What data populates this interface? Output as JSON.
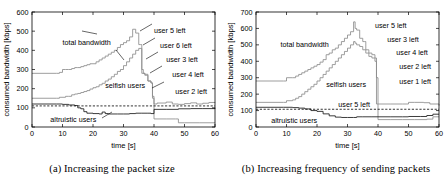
{
  "figure": {
    "panels": [
      {
        "id": "panel-a",
        "caption": "(a) Increasing the packet size",
        "chart_index": 0
      },
      {
        "id": "panel-b",
        "caption": "(b) Increasing frequency of sending packets",
        "chart_index": 1
      }
    ]
  },
  "chart_data": [
    {
      "type": "line",
      "title": "",
      "xlabel": "time [s]",
      "ylabel": "consumed bandwidth [kbps]",
      "xlim": [
        0,
        60
      ],
      "ylim": [
        0,
        600
      ],
      "xticks": [
        0,
        10,
        20,
        30,
        40,
        50,
        60
      ],
      "yticks": [
        0,
        100,
        200,
        300,
        400,
        500,
        600
      ],
      "grid": false,
      "legend": "none",
      "series": [
        {
          "name": "total bandwidth",
          "color": "#8c8c8c",
          "style": "step-gray",
          "x": [
            0,
            8,
            9,
            10,
            11,
            12,
            13,
            14,
            15,
            16,
            17,
            18,
            19,
            20,
            21,
            22,
            23,
            24,
            25,
            26,
            27,
            28,
            29,
            30,
            31,
            32,
            33,
            34,
            35,
            35.5,
            36,
            36.5,
            37,
            38,
            39,
            39.5,
            40,
            41,
            44,
            46,
            48,
            50,
            52,
            54,
            56,
            58,
            60
          ],
          "y": [
            280,
            280,
            285,
            300,
            300,
            300,
            305,
            310,
            310,
            315,
            320,
            325,
            330,
            330,
            340,
            350,
            360,
            370,
            380,
            390,
            400,
            415,
            430,
            440,
            450,
            470,
            510,
            490,
            430,
            430,
            300,
            280,
            275,
            240,
            230,
            160,
            120,
            125,
            130,
            120,
            118,
            122,
            126,
            120,
            124,
            128,
            130
          ]
        },
        {
          "name": "selfish users",
          "color": "#8c8c8c",
          "style": "step-gray",
          "x": [
            0,
            8,
            9,
            11,
            12,
            13,
            14,
            15,
            16,
            17,
            18,
            19,
            20,
            21,
            22,
            23,
            24,
            25,
            26,
            27,
            28,
            29,
            30,
            31,
            32,
            33,
            34,
            35,
            36,
            37,
            38,
            39,
            39.5,
            40,
            44,
            47,
            48,
            50,
            55,
            60
          ],
          "y": [
            150,
            150,
            155,
            160,
            160,
            168,
            172,
            175,
            180,
            185,
            190,
            198,
            205,
            210,
            220,
            228,
            240,
            250,
            262,
            275,
            290,
            300,
            320,
            340,
            360,
            380,
            400,
            410,
            280,
            270,
            240,
            230,
            150,
            42,
            42,
            42,
            22,
            22,
            22,
            22
          ]
        },
        {
          "name": "altruistic users",
          "color": "#1a1a1a",
          "style": "step-black",
          "x": [
            0,
            8,
            10,
            12,
            14,
            15,
            16,
            17,
            18,
            20,
            22,
            23,
            24,
            25,
            28,
            30,
            32,
            34,
            36,
            38,
            39,
            40,
            44,
            48,
            52,
            56,
            60
          ],
          "y": [
            120,
            120,
            118,
            115,
            112,
            100,
            95,
            80,
            72,
            70,
            68,
            78,
            70,
            68,
            68,
            68,
            70,
            72,
            72,
            72,
            70,
            92,
            92,
            95,
            96,
            96,
            100
          ]
        },
        {
          "name": "threshold",
          "color": "#000000",
          "style": "dashed",
          "x": [
            0,
            60
          ],
          "y": [
            110,
            110
          ]
        }
      ],
      "annotations": [
        {
          "text": "total bandwidth",
          "x": 10,
          "y": 440
        },
        {
          "text": "selfish users",
          "x": 24,
          "y": 215
        },
        {
          "text": "altruistic users",
          "x": 6,
          "y": 40
        },
        {
          "text": "user 5 left",
          "x": 40,
          "y": 505
        },
        {
          "text": "user 6 left",
          "x": 42,
          "y": 425
        },
        {
          "text": "user 3 left",
          "x": 44,
          "y": 350
        },
        {
          "text": "user 4 left",
          "x": 46,
          "y": 275
        },
        {
          "text": "user 2 left",
          "x": 47,
          "y": 185
        }
      ]
    },
    {
      "type": "line",
      "title": "",
      "xlabel": "time [s]",
      "ylabel": "consumed bandwidth [kbps]",
      "xlim": [
        0,
        60
      ],
      "ylim": [
        0,
        700
      ],
      "xticks": [
        0,
        10,
        20,
        30,
        40,
        50,
        60
      ],
      "yticks": [
        0,
        100,
        200,
        300,
        400,
        500,
        600,
        700
      ],
      "grid": false,
      "legend": "none",
      "series": [
        {
          "name": "total bandwidth",
          "color": "#8c8c8c",
          "style": "step-gray",
          "x": [
            0,
            9,
            10,
            12,
            13,
            14,
            15,
            16,
            17,
            18,
            19,
            20,
            21,
            22,
            23,
            24,
            25,
            26,
            27,
            28,
            29,
            30,
            31,
            32,
            32.5,
            33,
            34,
            35,
            35.5,
            36,
            37,
            38,
            39,
            39.5,
            40,
            44,
            48,
            50,
            52,
            55,
            57,
            60
          ],
          "y": [
            280,
            280,
            300,
            300,
            310,
            320,
            330,
            340,
            350,
            360,
            370,
            380,
            395,
            410,
            440,
            450,
            470,
            480,
            500,
            520,
            540,
            560,
            580,
            640,
            600,
            590,
            540,
            520,
            520,
            470,
            450,
            440,
            420,
            300,
            140,
            140,
            140,
            150,
            150,
            148,
            140,
            130
          ]
        },
        {
          "name": "selfish users",
          "color": "#8c8c8c",
          "style": "step-gray",
          "x": [
            0,
            9,
            10,
            12,
            13,
            14,
            15,
            16,
            17,
            18,
            19,
            20,
            21,
            22,
            23,
            24,
            25,
            26,
            27,
            28,
            29,
            30,
            31,
            32,
            32.5,
            33,
            34,
            35,
            36,
            37,
            38,
            39,
            39.5,
            40,
            44,
            48,
            52,
            56,
            58,
            60
          ],
          "y": [
            150,
            150,
            160,
            165,
            175,
            185,
            200,
            215,
            230,
            245,
            260,
            280,
            300,
            320,
            340,
            360,
            380,
            400,
            420,
            440,
            460,
            480,
            500,
            520,
            510,
            500,
            490,
            470,
            450,
            430,
            420,
            400,
            140,
            45,
            45,
            45,
            45,
            48,
            62,
            62
          ]
        },
        {
          "name": "altruistic users",
          "color": "#1a1a1a",
          "style": "step-black",
          "x": [
            0,
            9,
            12,
            14,
            16,
            18,
            20,
            22,
            24,
            26,
            28,
            30,
            32,
            33,
            35,
            38,
            40,
            44,
            48,
            50,
            54,
            56,
            58,
            60
          ],
          "y": [
            120,
            120,
            118,
            115,
            110,
            100,
            95,
            80,
            68,
            60,
            58,
            58,
            58,
            62,
            62,
            62,
            62,
            62,
            62,
            64,
            64,
            70,
            78,
            78
          ]
        },
        {
          "name": "threshold",
          "color": "#000000",
          "style": "dashed",
          "x": [
            0,
            60
          ],
          "y": [
            108,
            108
          ]
        }
      ],
      "annotations": [
        {
          "text": "total bandwidth",
          "x": 8,
          "y": 500
        },
        {
          "text": "selfish users",
          "x": 23,
          "y": 260
        },
        {
          "text": "altruistic users",
          "x": 5,
          "y": 40
        },
        {
          "text": "user 5 left",
          "x": 39,
          "y": 620
        },
        {
          "text": "user 3 left",
          "x": 43,
          "y": 535
        },
        {
          "text": "user 4 left",
          "x": 46,
          "y": 450
        },
        {
          "text": "user 2 left",
          "x": 47,
          "y": 365
        },
        {
          "text": "user 1 left",
          "x": 47,
          "y": 275
        },
        {
          "text": "user 5 left",
          "x": 27,
          "y": 135
        }
      ]
    }
  ]
}
